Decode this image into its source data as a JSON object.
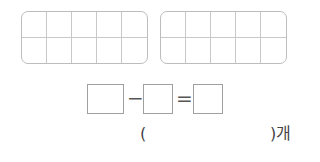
{
  "ten_frames": [
    {
      "rows": 2,
      "cols": 5,
      "filled": []
    },
    {
      "rows": 2,
      "cols": 5,
      "filled": []
    }
  ],
  "equation": {
    "boxes": [
      "",
      "",
      ""
    ],
    "minus": "−",
    "equals": "="
  },
  "answer": {
    "open_paren": "(",
    "value": "",
    "close_paren": ")개"
  }
}
